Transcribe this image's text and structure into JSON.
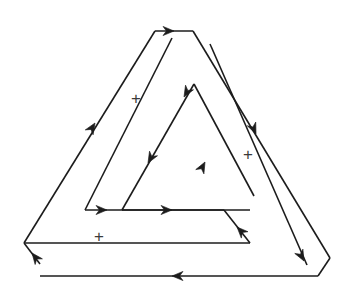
{
  "figure": {
    "name": "penrose-triangle-oriented",
    "background_color": "#ffffff",
    "stroke_color": "#1c1c1c",
    "stroke_width": 1.6,
    "width": 350,
    "height": 293
  },
  "outlines": {
    "outer_bar": "M 155 31 L 24 243 L 24 243 L 40 264 L 40 276 L 318 276 L 318 276 L 330 258 L 193 31 Z",
    "outer_left_edge": "M 155 31 L 24 243",
    "outer_bottom_edge": "M 40 276 L 318 276",
    "outer_right_edge": "M 193 31 L 330 258",
    "notch_left": "M 24 243 L 40 264",
    "notch_right": "M 318 276 L 330 258",
    "top_cap": "M 155 31 L 193 31",
    "band_left_inner": "M 172 38 L 85 210",
    "band_bottom_inner": "M 85 210 L 250 210",
    "band_right_inner": "M 210 44 L 307 265",
    "inner_tri_left": "M 194 84 L 122 210",
    "inner_tri_right": "M 194 84 L 254 196",
    "inner_tri_base": "M 122 210 L 224 210",
    "inner_bottom_band": "M 24 243 L 250 243",
    "inner_right_lower": "M 224 210 L 250 243"
  },
  "arrows": [
    {
      "name": "arrow-top-edge",
      "direction": "right",
      "x": 174,
      "y": 31,
      "angle_deg": 0
    },
    {
      "name": "arrow-outer-left-up",
      "direction": "up-right",
      "x": 95,
      "y": 123,
      "angle_deg": -58
    },
    {
      "name": "arrow-outer-bottom-left",
      "direction": "left",
      "x": 172,
      "y": 276,
      "angle_deg": 180
    },
    {
      "name": "arrow-notch-left-up",
      "direction": "up-left",
      "x": 32,
      "y": 253,
      "angle_deg": -128
    },
    {
      "name": "arrow-right-band-down",
      "direction": "down-right",
      "x": 256,
      "y": 134,
      "angle_deg": 66
    },
    {
      "name": "arrow-notch-right-down",
      "direction": "down-right",
      "x": 304,
      "y": 261,
      "angle_deg": 62
    },
    {
      "name": "arrow-inner-apex-down-left",
      "direction": "down-left",
      "x": 184,
      "y": 97,
      "angle_deg": 120
    },
    {
      "name": "arrow-inner-left-down",
      "direction": "down-left",
      "x": 148,
      "y": 163,
      "angle_deg": 120
    },
    {
      "name": "arrow-inner-right-up",
      "direction": "up-right",
      "x": 205,
      "y": 162,
      "angle_deg": -62
    },
    {
      "name": "arrow-band-bottom-right-1",
      "direction": "right",
      "x": 107,
      "y": 210,
      "angle_deg": 0
    },
    {
      "name": "arrow-band-bottom-right-2",
      "direction": "right",
      "x": 172,
      "y": 210,
      "angle_deg": 0
    },
    {
      "name": "arrow-inner-right-lower-up",
      "direction": "up-left",
      "x": 237,
      "y": 227,
      "angle_deg": -134
    }
  ],
  "labels": {
    "plus_signs": [
      {
        "name": "plus-left-face",
        "text": "+",
        "x": 136,
        "y": 98
      },
      {
        "name": "plus-right-face",
        "text": "+",
        "x": 248,
        "y": 154
      },
      {
        "name": "plus-bottom-face",
        "text": "+",
        "x": 99,
        "y": 236
      }
    ]
  }
}
